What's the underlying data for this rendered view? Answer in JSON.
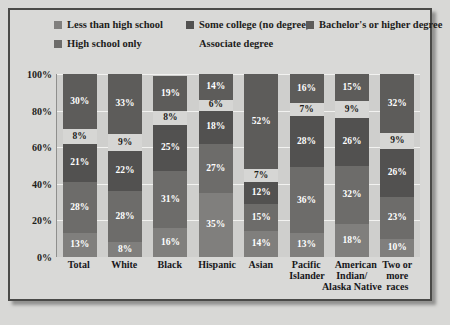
{
  "chart_data": {
    "type": "bar",
    "subtype": "stacked-100",
    "title": "",
    "xlabel": "",
    "ylabel": "",
    "ylim": [
      0,
      100
    ],
    "ytick_labels": [
      "0%",
      "20%",
      "40%",
      "60%",
      "80%",
      "100%"
    ],
    "ytick_values": [
      0,
      20,
      40,
      60,
      80,
      100
    ],
    "grid": true,
    "legend_position": "top",
    "categories": [
      "Total",
      "White",
      "Black",
      "Hispanic",
      "Asian",
      "Pacific Islander",
      "American Indian/ Alaska Native",
      "Two or more races"
    ],
    "category_lines": [
      [
        "Total"
      ],
      [
        "White"
      ],
      [
        "Black"
      ],
      [
        "Hispanic"
      ],
      [
        "Asian"
      ],
      [
        "Pacific",
        "Islander"
      ],
      [
        "American",
        "Indian/",
        "Alaska Native"
      ],
      [
        "Two or",
        "more races"
      ]
    ],
    "series": [
      {
        "name": "Less than high school",
        "color": "#807f7d",
        "text_color": "#ffffff",
        "values": [
          13,
          8,
          16,
          35,
          14,
          13,
          18,
          10
        ],
        "labels": [
          "13%",
          "8%",
          "16%",
          "35%",
          "14%",
          "13%",
          "18%",
          "10%"
        ]
      },
      {
        "name": "High school only",
        "color": "#6d6c6a",
        "text_color": "#ffffff",
        "values": [
          28,
          28,
          31,
          27,
          15,
          36,
          32,
          23
        ],
        "labels": [
          "28%",
          "28%",
          "31%",
          "27%",
          "15%",
          "36%",
          "32%",
          "23%"
        ]
      },
      {
        "name": "Some college (no degree)",
        "color": "#525150",
        "text_color": "#ffffff",
        "values": [
          21,
          22,
          25,
          18,
          12,
          28,
          26,
          26
        ],
        "labels": [
          "21%",
          "22%",
          "25%",
          "18%",
          "12%",
          "28%",
          "26%",
          "26%"
        ]
      },
      {
        "name": "Associate degree",
        "color": "#d6d6d4",
        "text_color": "#1d1d1b",
        "values": [
          8,
          9,
          8,
          6,
          7,
          7,
          9,
          9
        ],
        "labels": [
          "8%",
          "9%",
          "8%",
          "6%",
          "7%",
          "7%",
          "9%",
          "9%"
        ]
      },
      {
        "name": "Bachelor's or higher degree",
        "color": "#5d5c5a",
        "text_color": "#ffffff",
        "values": [
          30,
          33,
          19,
          14,
          52,
          16,
          15,
          32
        ],
        "labels": [
          "30%",
          "33%",
          "19%",
          "14%",
          "52%",
          "16%",
          "15%",
          "32%"
        ]
      }
    ]
  },
  "legend": {
    "row1": [
      {
        "label": "Less than high school",
        "swatch": "#807f7d",
        "has_swatch": true
      },
      {
        "label": "Some college (no degree)",
        "swatch": "#525150",
        "has_swatch": true
      },
      {
        "label": "Bachelor's or higher degree",
        "swatch": "#5d5c5a",
        "has_swatch": true
      }
    ],
    "row2": [
      {
        "label": "High school only",
        "swatch": "#6d6c6a",
        "has_swatch": true
      },
      {
        "label": "Associate degree",
        "swatch": "#d6d6d4",
        "has_swatch": false
      }
    ]
  },
  "colors": {
    "page_background": "#d8d8d6",
    "frame_background": "#d9d9d7",
    "frame_border": "#4a4a48",
    "plot_background": "#cfcfcd",
    "gridline": "#f2f2f0",
    "text": "#1d1d1b"
  }
}
